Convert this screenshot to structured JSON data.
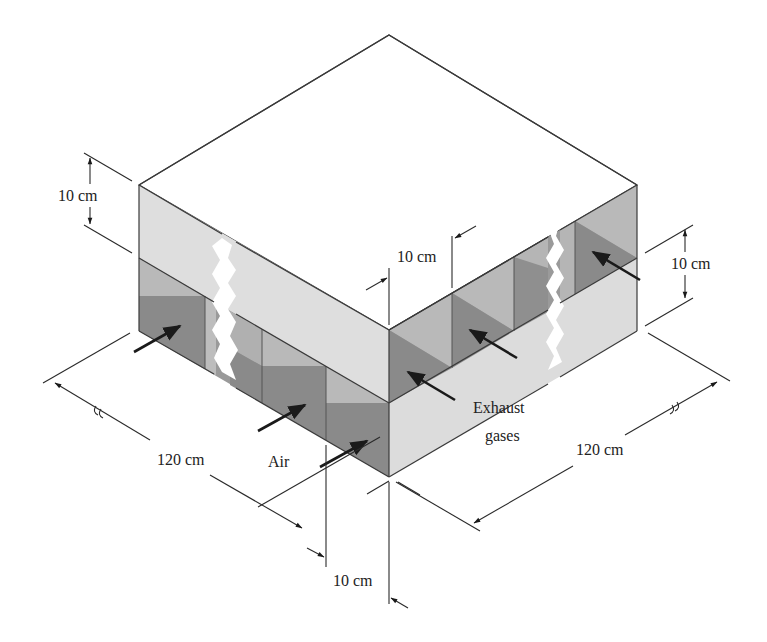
{
  "figure": {
    "type": "isometric cross-flow heat exchanger schematic",
    "labels": {
      "air": "Air",
      "exhaust_line1": "Exhaust",
      "exhaust_line2": "gases"
    },
    "dimensions": {
      "layer_height_left": "10 cm",
      "channel_width_top": "10 cm",
      "layer_height_right": "10 cm",
      "length_left": "120 cm",
      "length_right": "120 cm",
      "channel_width_bottom": "10 cm"
    },
    "colors": {
      "background": "#ffffff",
      "top_face": "#ffffff",
      "light_face": "#dcdcdc",
      "channel_light": "#b9b9b9",
      "channel_dark": "#8c8c8c",
      "edge": "#3a3a3a",
      "arrow": "#1a1a1a"
    }
  }
}
